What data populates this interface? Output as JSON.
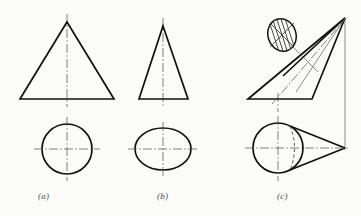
{
  "page": {
    "background_color": "#fbfbfa",
    "ink_color": "#111111",
    "thin_ink_color": "#555555",
    "width": 361,
    "height": 216
  },
  "figure": {
    "title": "",
    "type": "orthographic-projection-drawing",
    "labels": {
      "a": "(a)",
      "b": "(b)",
      "c": "(c)"
    }
  },
  "views": {
    "a": {
      "name": "right-circular-cone",
      "front_view": {
        "shape": "isosceles-triangle",
        "apex": [
          67,
          22
        ],
        "base_left": [
          20,
          99
        ],
        "base_right": [
          114,
          99
        ],
        "centerline_x": 67,
        "centerline_top": 14,
        "centerline_bottom": 107
      },
      "top_view": {
        "shape": "circle",
        "center": [
          67,
          149
        ],
        "radius": 25,
        "horizontal_centerline": [
          35,
          99
        ],
        "vertical_centerline": [
          35,
          99
        ]
      }
    },
    "b": {
      "name": "oblique-cone-elliptical-base",
      "front_view": {
        "shape": "isosceles-triangle",
        "apex": [
          163,
          26
        ],
        "base_left": [
          139,
          99
        ],
        "base_right": [
          188,
          99
        ],
        "centerline_x": 163,
        "centerline_top": 18,
        "centerline_bottom": 107
      },
      "top_view": {
        "shape": "ellipse",
        "center": [
          163,
          149
        ],
        "radius_x": 28,
        "radius_y": 21
      }
    },
    "c": {
      "name": "oblique-cone-tilted-axis",
      "front_view": {
        "shape": "oblique-triangle",
        "apex": [
          345,
          18
        ],
        "base_left": [
          248,
          99
        ],
        "base_right": [
          312,
          99
        ],
        "axis_line_from": [
          278,
          99
        ],
        "axis_line_to": [
          345,
          18
        ],
        "vertical_projector_x": 345,
        "vertical_projector_from": 18,
        "vertical_projector_to": 149
      },
      "top_view": {
        "shape": "circle-with-tangent-lines",
        "center": [
          278,
          148
        ],
        "radius": 25,
        "apex_point": [
          345,
          148
        ],
        "hidden_arc": "dashed"
      },
      "detail_circle": {
        "shape": "hatched-circle",
        "center": [
          282,
          35
        ],
        "radius_x": 15,
        "radius_y": 17,
        "hatching": "vertical-lines-with-cross-diagonals",
        "leader_from": [
          292,
          46
        ],
        "leader_to": [
          317,
          71
        ]
      }
    }
  },
  "line_styles": {
    "visible_outline": "solid-thick",
    "center_line": "dash-dot-thin",
    "hidden_line": "dashed-thin",
    "projection_line": "solid-thin",
    "leader_line": "solid-thin"
  }
}
